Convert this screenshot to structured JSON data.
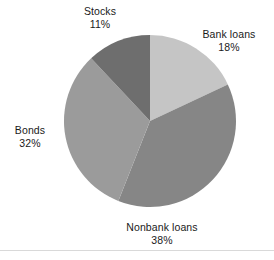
{
  "chart_data": {
    "type": "pie",
    "title": "",
    "subtitle": "",
    "xlabel": "",
    "ylabel": "",
    "legend_position": "none",
    "grid": false,
    "start_angle_deg": 0,
    "direction": "clockwise",
    "center": {
      "cx": 150,
      "cy": 121,
      "r": 86
    },
    "categories": [
      "Bank loans",
      "Nonbank loans",
      "Bonds",
      "Stocks"
    ],
    "values": [
      18,
      38,
      32,
      11
    ],
    "value_suffix": "%",
    "colors": [
      "#c5c5c5",
      "#868686",
      "#9b9b9b",
      "#6e6e6e"
    ],
    "slices": [
      {
        "label": "Bank loans",
        "value": 18,
        "value_text": "18%",
        "color": "#c5c5c5",
        "start_deg": 0,
        "end_deg": 64.8
      },
      {
        "label": "Nonbank loans",
        "value": 38,
        "value_text": "38%",
        "color": "#868686",
        "start_deg": 64.8,
        "end_deg": 201.6
      },
      {
        "label": "Bonds",
        "value": 32,
        "value_text": "32%",
        "color": "#9b9b9b",
        "start_deg": 201.6,
        "end_deg": 316.8
      },
      {
        "label": "Stocks",
        "value": 11,
        "value_text": "11%",
        "color": "#6e6e6e",
        "start_deg": 316.8,
        "end_deg": 360
      }
    ]
  },
  "labels": {
    "bank_loans": {
      "name": "Bank loans",
      "value": "18%"
    },
    "nonbank_loans": {
      "name": "Nonbank loans",
      "value": "38%"
    },
    "bonds": {
      "name": "Bonds",
      "value": "32%"
    },
    "stocks": {
      "name": "Stocks",
      "value": "11%"
    }
  },
  "style": {
    "background": "#ffffff",
    "text_color": "#1a1a1a",
    "rule_color": "#d9d9d9"
  }
}
